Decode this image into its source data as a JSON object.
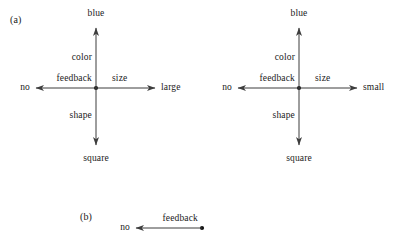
{
  "figure": {
    "panels": [
      {
        "tag": "(a)",
        "tag_x": 10,
        "tag_y": 24,
        "diagrams": [
          {
            "name": "left-cross-diagram",
            "center_x": 96,
            "center_y": 88,
            "arms": [
              {
                "direction": "up",
                "edge_label": "color",
                "terminal_label": "blue",
                "terminal_x": 96,
                "terminal_y": 28
              },
              {
                "direction": "right",
                "edge_label": "size",
                "terminal_label": "large",
                "terminal_x": 155,
                "terminal_y": 88
              },
              {
                "direction": "left",
                "edge_label": "feedback",
                "terminal_label": "no",
                "terminal_x": 36,
                "terminal_y": 88
              },
              {
                "direction": "down",
                "edge_label": "shape",
                "terminal_label": "square",
                "terminal_x": 96,
                "terminal_y": 145
              }
            ]
          },
          {
            "name": "right-cross-diagram",
            "center_x": 299,
            "center_y": 88,
            "arms": [
              {
                "direction": "up",
                "edge_label": "color",
                "terminal_label": "blue",
                "terminal_x": 299,
                "terminal_y": 28
              },
              {
                "direction": "right",
                "edge_label": "size",
                "terminal_label": "small",
                "terminal_x": 357,
                "terminal_y": 88
              },
              {
                "direction": "left",
                "edge_label": "feedback",
                "terminal_label": "no",
                "terminal_x": 238,
                "terminal_y": 88
              },
              {
                "direction": "down",
                "edge_label": "shape",
                "terminal_label": "square",
                "terminal_x": 299,
                "terminal_y": 145
              }
            ]
          }
        ]
      },
      {
        "tag": "(b)",
        "tag_x": 80,
        "tag_y": 221,
        "diagrams": [
          {
            "name": "single-arrow-diagram",
            "center_x": 202,
            "center_y": 228,
            "arms": [
              {
                "direction": "left",
                "edge_label": "feedback",
                "terminal_label": "no",
                "terminal_x": 136,
                "terminal_y": 228
              }
            ]
          }
        ]
      }
    ],
    "colors": {
      "stroke": "#3d3d3d",
      "node": "#111111",
      "text": "#1a1a1a",
      "background": "#ffffff"
    }
  }
}
